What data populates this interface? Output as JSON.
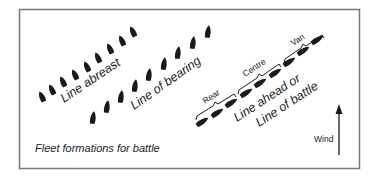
{
  "diagram": {
    "caption": "Fleet formations for battle",
    "formations": {
      "line_abreast": {
        "label": "Line abreast",
        "ship_count": 9
      },
      "line_of_bearing": {
        "label": "Line of bearing",
        "ship_count": 9
      },
      "line_ahead": {
        "label_line1": "Line ahead or",
        "label_line2": "Line of battle",
        "ship_count": 9,
        "divisions": [
          "Rear",
          "Centre",
          "Van"
        ]
      }
    },
    "wind": {
      "label": "Wind",
      "direction": "up"
    },
    "colors": {
      "ink": "#1a1a1a",
      "frame": "#777777",
      "background": "#ffffff"
    }
  }
}
